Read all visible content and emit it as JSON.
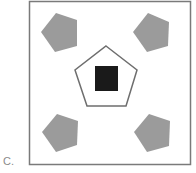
{
  "option": {
    "label": "C."
  },
  "figure": {
    "frame": {
      "x": 29.5,
      "y": 1.5,
      "width": 161,
      "height": 163,
      "stroke": "#7a7a7a"
    },
    "corner_shapes": [
      {
        "name": "top-left-pentagon",
        "shape": "pentagon",
        "fill": "#9b9b9b",
        "points": "56,13 77,20 77,46 55,52 41,32"
      },
      {
        "name": "top-right-pentagon",
        "shape": "pentagon",
        "fill": "#9b9b9b",
        "points": "148,13 169,22 168,46 147,52 133,32"
      },
      {
        "name": "bottom-left-pentagon",
        "shape": "pentagon",
        "fill": "#9b9b9b",
        "points": "57,114 78,121 77,145 56,152 42,132"
      },
      {
        "name": "bottom-right-pentagon",
        "shape": "pentagon",
        "fill": "#9b9b9b",
        "points": "149,114 170,121 169,146 147,152 134,132"
      }
    ],
    "center_shape": {
      "shape": "pentagon-outline",
      "stroke": "#6e6e6e",
      "points": "106,46 137,70 126,106 87,106 75,70"
    },
    "inner_shape": {
      "shape": "square",
      "fill": "#1a1a1a",
      "x": 95,
      "y": 66,
      "width": 23,
      "height": 25
    }
  }
}
